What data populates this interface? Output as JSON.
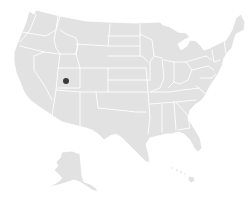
{
  "map": {
    "region": "United States",
    "style": {
      "land_color": "#e2e2e2",
      "border_color": "#ffffff",
      "background": "#ffffff",
      "marker_color": "#3a3a3a"
    },
    "insets": [
      "Alaska",
      "Hawaii"
    ],
    "markers": [
      {
        "name": "location-marker",
        "approx_state": "Utah",
        "x": 66,
        "y": 81,
        "r": 3
      }
    ]
  }
}
